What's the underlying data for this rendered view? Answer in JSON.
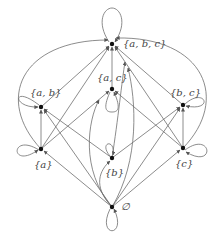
{
  "diagram": {
    "nodes": [
      {
        "id": "abc",
        "label": "{a, b, c}",
        "x": 112,
        "y": 44
      },
      {
        "id": "ac",
        "label": "{a, c}",
        "x": 112,
        "y": 89
      },
      {
        "id": "ab",
        "label": "{a, b}",
        "x": 41,
        "y": 107
      },
      {
        "id": "bc",
        "label": "{b, c}",
        "x": 183,
        "y": 105
      },
      {
        "id": "a",
        "label": "{a}",
        "x": 41,
        "y": 149
      },
      {
        "id": "b",
        "label": "{b}",
        "x": 112,
        "y": 158
      },
      {
        "id": "c",
        "label": "{c}",
        "x": 183,
        "y": 148
      },
      {
        "id": "empty",
        "label": "∅",
        "x": 112,
        "y": 207
      }
    ],
    "edge_color": "#6e6e6e",
    "node_color": "#111111"
  }
}
